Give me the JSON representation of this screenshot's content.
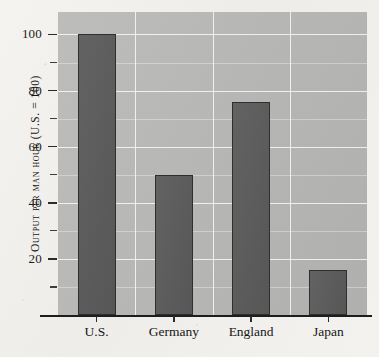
{
  "chart_data": {
    "type": "bar",
    "title": "",
    "subtitle": "",
    "xlabel": "",
    "ylabel": "Output per man hour (U.S. = 100)",
    "categories": [
      "U.S.",
      "Germany",
      "England",
      "Japan"
    ],
    "values": [
      100,
      50,
      76,
      16
    ],
    "series": [
      {
        "name": "Output per man hour",
        "values": [
          100,
          50,
          76,
          16
        ]
      }
    ],
    "ylim": [
      0,
      108
    ],
    "y_major_ticks": [
      20,
      40,
      60,
      80,
      100
    ],
    "y_major_tick_labels": [
      "20",
      "40",
      "60",
      "80",
      "100"
    ],
    "y_minor_ticks": [
      10,
      30,
      50,
      70,
      90
    ],
    "grid": true,
    "grid_color": "#ffffff",
    "legend": "none",
    "legend_position": "none",
    "plot_background_color": "#b9b9b7",
    "bar_color": "#5c5c5c",
    "bar_edge_color": "#2f2f2f",
    "axis_color": "#1d1d1d",
    "page_background_color": "#f2f1ee",
    "annotations": []
  },
  "axis": {
    "y_title": "Output per man hour (U.S. = 100)"
  }
}
